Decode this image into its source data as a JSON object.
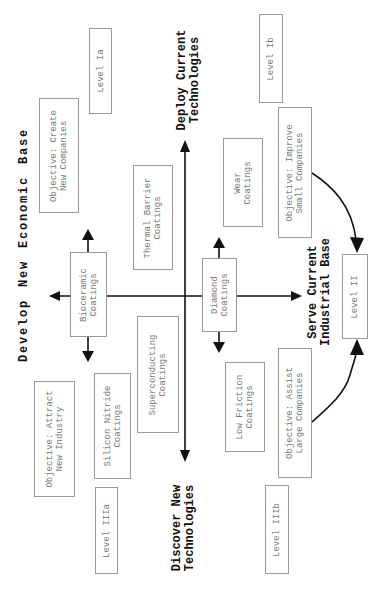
{
  "colors": {
    "line": "#111111",
    "box_border": "#9a9a9a",
    "box_text": "#7a7a7a",
    "heading_text": "#111111"
  },
  "axes": {
    "top": [
      "Deploy Current",
      "Technologies"
    ],
    "bottom": [
      "Discover New",
      "Technologies"
    ],
    "left": "Develop New Economic Base",
    "right": [
      "Serve Current",
      "Industrial Base"
    ]
  },
  "boxes": {
    "level_ia": [
      "Level Ia"
    ],
    "objective_create": [
      "Objective: Create",
      "New Companies"
    ],
    "thermal_barrier": [
      "Thermal Barrier",
      "Coatings"
    ],
    "bioceramic": [
      "Bioceramic",
      "Coatings"
    ],
    "superconducting": [
      "Superconducting",
      "Coatings"
    ],
    "silicon_nitride": [
      "Silicon Nitride",
      "Coatings"
    ],
    "objective_attract": [
      "Objective: Attract",
      "New Industry"
    ],
    "level_iiia": [
      "Level IIIa"
    ],
    "level_ib": [
      "Level Ib"
    ],
    "wear": [
      "Wear",
      "Coatings"
    ],
    "objective_improve": [
      "Objective: Improve",
      "Small Companies"
    ],
    "diamond": [
      "Diamond",
      "Coatings"
    ],
    "low_friction": [
      "Low Friction",
      "Coatings"
    ],
    "objective_assist": [
      "Objective: Assist",
      "Large Companies"
    ],
    "level_iiib": [
      "Level IIIb"
    ],
    "level_ii": [
      "Level II"
    ]
  }
}
